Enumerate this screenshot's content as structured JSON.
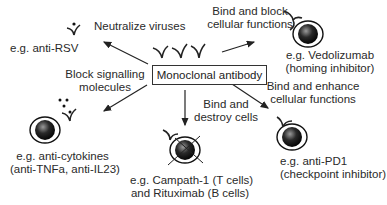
{
  "center": {
    "label": "Monoclonal antibody"
  },
  "mechanisms": [
    {
      "id": "neutralize",
      "label_lines": [
        "Neutralize viruses"
      ],
      "example_lines": [
        "e.g. anti-RSV"
      ]
    },
    {
      "id": "block-signalling",
      "label_lines": [
        "Block signalling",
        "molecules"
      ],
      "example_lines": [
        "e.g. anti-cytokines",
        "(anti-TNFa, anti-IL23)"
      ]
    },
    {
      "id": "destroy",
      "label_lines": [
        "Bind and",
        "destroy cells"
      ],
      "example_lines": [
        "e.g. Campath-1 (T cells)",
        "and Rituximab (B cells)"
      ]
    },
    {
      "id": "enhance",
      "label_lines": [
        "Bind and enhance",
        "cellular functions"
      ],
      "example_lines": [
        "e.g. anti-PD1",
        "(checkpoint inhibitor)"
      ]
    },
    {
      "id": "block-cellular",
      "label_lines": [
        "Bind and block",
        "cellular functions"
      ],
      "example_lines": [
        "e.g. Vedolizumab",
        "(homing inhibitor)"
      ]
    }
  ],
  "icons": [
    "antibody-icon",
    "cell-icon",
    "virus-icon",
    "cytokine-icon",
    "arrow-icon"
  ]
}
